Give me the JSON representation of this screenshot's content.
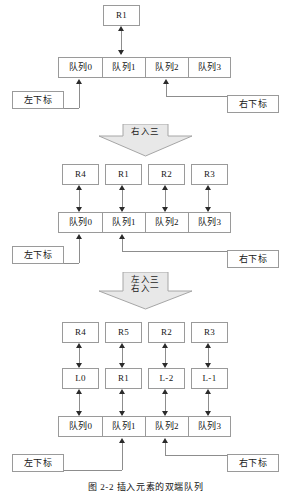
{
  "figure": {
    "caption": "图 2-2   插入元素的双端队列",
    "colors": {
      "box_border": "#9a9a9a",
      "line": "#8d8d8d",
      "arrow_head": "#2b2b2b",
      "block_arrow_fill": "#e8e8e8",
      "block_arrow_border": "#a6a6a6",
      "page_background": "#ffffff"
    }
  },
  "labels": {
    "left_index": "左下标",
    "right_index": "右下标"
  },
  "queue_cells": [
    "队列0",
    "队列1",
    "队列2",
    "队列3"
  ],
  "stages": [
    {
      "name": "stage-initial",
      "registers": [
        {
          "label": "R1",
          "slot": 1
        }
      ],
      "queue": [
        "队列0",
        "队列1",
        "队列2",
        "队列3"
      ],
      "left_index_target_slot": 0,
      "right_index_target_slot": 2
    },
    {
      "name": "stage-after-right-insert-three",
      "registers": [
        {
          "label": "R4",
          "slot": 0
        },
        {
          "label": "R1",
          "slot": 1
        },
        {
          "label": "R2",
          "slot": 2
        },
        {
          "label": "R3",
          "slot": 3
        }
      ],
      "queue": [
        "队列0",
        "队列1",
        "队列2",
        "队列3"
      ],
      "left_index_target_slot": 0,
      "right_index_target_slot": 1
    },
    {
      "name": "stage-after-left-three-right-one",
      "registers_top": [
        {
          "label": "R4",
          "slot": 0
        },
        {
          "label": "R5",
          "slot": 1
        },
        {
          "label": "R2",
          "slot": 2
        },
        {
          "label": "R3",
          "slot": 3
        }
      ],
      "registers_mid": [
        {
          "label": "L0",
          "slot": 0
        },
        {
          "label": "R1",
          "slot": 1
        },
        {
          "label": "L-2",
          "slot": 2
        },
        {
          "label": "L-1",
          "slot": 3
        }
      ],
      "queue": [
        "队列0",
        "队列1",
        "队列2",
        "队列3"
      ],
      "left_index_target_slot": 1,
      "right_index_target_slot": 2
    }
  ],
  "transitions": [
    {
      "name": "transition-1",
      "lines": [
        "右入三"
      ]
    },
    {
      "name": "transition-2",
      "lines": [
        "左入三",
        "右入一"
      ]
    }
  ]
}
